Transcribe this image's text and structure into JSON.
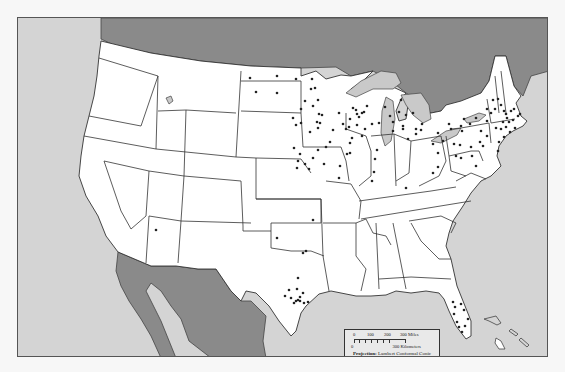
{
  "map": {
    "title": "Contiguous United States point distribution map",
    "colors": {
      "ocean": "#d4d4d4",
      "foreign_land": "#8a8a8a",
      "us_land": "#ffffff",
      "lakes": "#c9c9c9",
      "points": "#222222",
      "page_background": "#f7f7f7"
    },
    "regions_labeled_by_shading": [
      "Canada",
      "Mexico",
      "Pacific Ocean",
      "Atlantic Ocean",
      "Gulf of Mexico",
      "Great Lakes"
    ],
    "points": [
      [
        255,
        91
      ],
      [
        276,
        92
      ],
      [
        276,
        75
      ],
      [
        295,
        78
      ],
      [
        311,
        78
      ],
      [
        310,
        88
      ],
      [
        314,
        87
      ],
      [
        304,
        100
      ],
      [
        312,
        105
      ],
      [
        300,
        108
      ],
      [
        317,
        99
      ],
      [
        318,
        113
      ],
      [
        316,
        121
      ],
      [
        317,
        127
      ],
      [
        309,
        131
      ],
      [
        295,
        124
      ],
      [
        300,
        122
      ],
      [
        292,
        117
      ],
      [
        321,
        114
      ],
      [
        319,
        122
      ],
      [
        349,
        118
      ],
      [
        356,
        113
      ],
      [
        355,
        109
      ],
      [
        363,
        111
      ],
      [
        348,
        126
      ],
      [
        356,
        124
      ],
      [
        364,
        128
      ],
      [
        371,
        123
      ],
      [
        378,
        122
      ],
      [
        361,
        135
      ],
      [
        349,
        142
      ],
      [
        345,
        128
      ],
      [
        366,
        105
      ],
      [
        361,
        112
      ],
      [
        342,
        123
      ],
      [
        352,
        107
      ],
      [
        358,
        116
      ],
      [
        338,
        112
      ],
      [
        351,
        137
      ],
      [
        329,
        141
      ],
      [
        332,
        129
      ],
      [
        384,
        106
      ],
      [
        389,
        115
      ],
      [
        392,
        121
      ],
      [
        398,
        111
      ],
      [
        405,
        114
      ],
      [
        402,
        128
      ],
      [
        402,
        125
      ],
      [
        392,
        130
      ],
      [
        400,
        99
      ],
      [
        412,
        112
      ],
      [
        415,
        133
      ],
      [
        407,
        138
      ],
      [
        376,
        149
      ],
      [
        374,
        158
      ],
      [
        373,
        171
      ],
      [
        371,
        180
      ],
      [
        338,
        177
      ],
      [
        346,
        153
      ],
      [
        349,
        152
      ],
      [
        339,
        165
      ],
      [
        323,
        163
      ],
      [
        325,
        146
      ],
      [
        317,
        149
      ],
      [
        312,
        157
      ],
      [
        293,
        147
      ],
      [
        297,
        160
      ],
      [
        299,
        153
      ],
      [
        304,
        163
      ],
      [
        308,
        168
      ],
      [
        296,
        167
      ],
      [
        415,
        128
      ],
      [
        420,
        129
      ],
      [
        421,
        123
      ],
      [
        437,
        132
      ],
      [
        432,
        143
      ],
      [
        437,
        152
      ],
      [
        437,
        166
      ],
      [
        442,
        140
      ],
      [
        450,
        128
      ],
      [
        448,
        123
      ],
      [
        461,
        130
      ],
      [
        460,
        125
      ],
      [
        453,
        143
      ],
      [
        459,
        144
      ],
      [
        455,
        155
      ],
      [
        460,
        157
      ],
      [
        471,
        155
      ],
      [
        470,
        146
      ],
      [
        479,
        141
      ],
      [
        480,
        130
      ],
      [
        475,
        117
      ],
      [
        469,
        123
      ],
      [
        463,
        118
      ],
      [
        486,
        120
      ],
      [
        490,
        112
      ],
      [
        486,
        108
      ],
      [
        492,
        99
      ],
      [
        497,
        98
      ],
      [
        500,
        104
      ],
      [
        503,
        110
      ],
      [
        505,
        113
      ],
      [
        506,
        117
      ],
      [
        502,
        121
      ],
      [
        500,
        128
      ],
      [
        495,
        127
      ],
      [
        510,
        110
      ],
      [
        513,
        108
      ],
      [
        517,
        115
      ],
      [
        519,
        113
      ],
      [
        512,
        119
      ],
      [
        508,
        121
      ],
      [
        514,
        127
      ],
      [
        509,
        131
      ],
      [
        505,
        126
      ],
      [
        503,
        136
      ],
      [
        498,
        141
      ],
      [
        497,
        150
      ],
      [
        494,
        108
      ],
      [
        486,
        135
      ],
      [
        482,
        145
      ],
      [
        475,
        165
      ],
      [
        432,
        172
      ],
      [
        405,
        187
      ],
      [
        312,
        219
      ],
      [
        302,
        252
      ],
      [
        305,
        250
      ],
      [
        276,
        237
      ],
      [
        297,
        277
      ],
      [
        296,
        288
      ],
      [
        302,
        292
      ],
      [
        297,
        299
      ],
      [
        299,
        296
      ],
      [
        295,
        300
      ],
      [
        284,
        295
      ],
      [
        288,
        289
      ],
      [
        290,
        297
      ],
      [
        299,
        300
      ],
      [
        307,
        301
      ],
      [
        303,
        302
      ],
      [
        293,
        302
      ],
      [
        452,
        301
      ],
      [
        454,
        306
      ],
      [
        460,
        303
      ],
      [
        463,
        309
      ],
      [
        464,
        325
      ],
      [
        458,
        326
      ],
      [
        456,
        321
      ],
      [
        453,
        313
      ],
      [
        467,
        318
      ],
      [
        461,
        331
      ],
      [
        155,
        229
      ],
      [
        249,
        77
      ]
    ]
  },
  "legend": {
    "miles_ticks": [
      "0",
      "100",
      "200",
      "300 Miles"
    ],
    "km_label_zero": "0",
    "km_label": "300 Kilometers",
    "projection_label": "Projection:",
    "projection_value": "Lambert Conformal Conic",
    "parallels": "Standard Parallels 33°N, 45°N"
  }
}
